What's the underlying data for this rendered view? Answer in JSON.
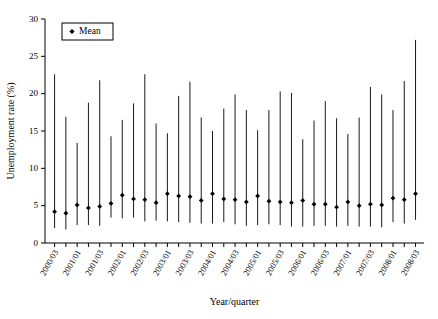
{
  "chart_data": {
    "type": "line",
    "title": "",
    "xlabel": "Year/quarter",
    "ylabel": "Unemployment rate (%)",
    "ylim": [
      0,
      30
    ],
    "yticks": [
      0,
      5,
      10,
      15,
      20,
      25,
      30
    ],
    "grid": false,
    "legend": {
      "position": "top-left",
      "entries": [
        {
          "label": "Mean",
          "marker": "diamond",
          "color": "#000000"
        }
      ]
    },
    "categories": [
      "2000/03",
      "2000/04",
      "2001/01",
      "2001/02",
      "2001/03",
      "2001/04",
      "2002/01",
      "2002/02",
      "2002/03",
      "2002/04",
      "2003/01",
      "2003/02",
      "2003/03",
      "2003/04",
      "2004/01",
      "2004/02",
      "2004/03",
      "2004/04",
      "2005/01",
      "2005/02",
      "2005/03",
      "2005/04",
      "2006/01",
      "2006/02",
      "2006/03",
      "2006/04",
      "2007/01",
      "2007/02",
      "2007/03",
      "2007/04",
      "2008/01",
      "2008/02",
      "2008/03"
    ],
    "tick_labels_shown": [
      "2000/03",
      "2001/01",
      "2001/03",
      "2002/01",
      "2002/03",
      "2003/01",
      "2003/03",
      "2004/01",
      "2004/03",
      "2005/01",
      "2005/03",
      "2006/01",
      "2006/03",
      "2007/01",
      "2007/03",
      "2008/01",
      "2008/03"
    ],
    "series": [
      {
        "name": "Mean",
        "values": [
          4.2,
          4.0,
          5.1,
          4.7,
          4.9,
          5.3,
          6.4,
          5.9,
          5.8,
          5.4,
          6.6,
          6.3,
          6.2,
          5.7,
          6.6,
          5.9,
          5.8,
          5.5,
          6.3,
          5.6,
          5.5,
          5.4,
          5.7,
          5.2,
          5.2,
          4.8,
          5.5,
          5.0,
          5.2,
          5.1,
          6.0,
          5.8,
          6.6
        ]
      }
    ],
    "whisker_max": [
      22.6,
      16.9,
      13.4,
      18.8,
      21.8,
      14.3,
      16.5,
      18.7,
      22.6,
      16.0,
      14.7,
      19.7,
      21.6,
      16.8,
      15.0,
      18.0,
      19.9,
      17.8,
      15.1,
      17.8,
      20.3,
      20.1,
      13.9,
      16.4,
      19.0,
      16.7,
      14.6,
      16.8,
      20.9,
      19.9,
      17.8,
      21.7,
      27.2
    ],
    "whisker_min": [
      2.0,
      1.8,
      2.4,
      2.4,
      2.3,
      3.4,
      3.3,
      3.4,
      2.9,
      3.0,
      2.9,
      2.8,
      2.7,
      2.6,
      2.6,
      2.8,
      2.5,
      2.3,
      2.4,
      2.5,
      2.4,
      2.2,
      2.2,
      2.3,
      2.3,
      2.2,
      2.3,
      2.2,
      2.2,
      2.1,
      2.8,
      2.6,
      3.1
    ]
  }
}
